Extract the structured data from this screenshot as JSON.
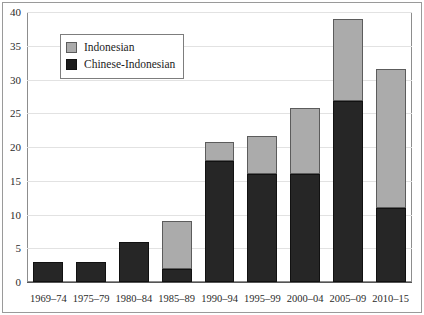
{
  "chart_data": {
    "type": "bar",
    "subtype": "stacked-vertical",
    "title": "",
    "subtitle": "",
    "xlabel": "",
    "ylabel": "",
    "categories": [
      "1969–74",
      "1975–79",
      "1980–84",
      "1985–89",
      "1990–94",
      "1995–99",
      "2000–04",
      "2005–09",
      "2010–15"
    ],
    "series": [
      {
        "name": "Chinese-Indonesian",
        "color": "#262626",
        "values": [
          3,
          3,
          6,
          2,
          18,
          16,
          16,
          26.8,
          11
        ]
      },
      {
        "name": "Indonesian",
        "color": "#ababab",
        "values": [
          0,
          0,
          0,
          7,
          2.7,
          5.7,
          9.8,
          12.2,
          20.6
        ]
      }
    ],
    "totals": [
      3,
      3,
      6,
      9,
      20.7,
      21.7,
      25.8,
      39,
      31.6
    ],
    "ylim": [
      0,
      40
    ],
    "yticks": [
      "0",
      "5",
      "10",
      "15",
      "20",
      "25",
      "30",
      "35",
      "40"
    ],
    "ytick_values": [
      0,
      5,
      10,
      15,
      20,
      25,
      30,
      35,
      40
    ],
    "grid": true,
    "grid_axis": "y",
    "legend_position": "upper-left-inside",
    "legend": [
      {
        "label": "Indonesian",
        "swatch": "light"
      },
      {
        "label": "Chinese-Indonesian",
        "swatch": "dark"
      }
    ]
  }
}
